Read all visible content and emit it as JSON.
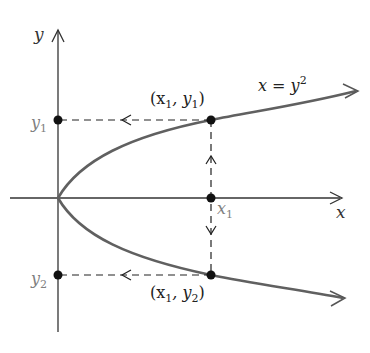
{
  "diagram": {
    "type": "graph-of-relation",
    "colors": {
      "axis": "#333333",
      "curve": "#606060",
      "dashed": "#222222",
      "point": "#111111",
      "grey_label": "#808080",
      "background": "#ffffff"
    },
    "axes": {
      "x_label": "x",
      "y_label": "y"
    },
    "curve": {
      "equation_lhs": "x = y",
      "equation_exp": "2"
    },
    "points": [
      {
        "name": "upper-point",
        "label_open": "(x",
        "sub1": "1",
        "label_mid": ", y",
        "sub2": "1",
        "label_close": ")"
      },
      {
        "name": "lower-point",
        "label_open": "(x",
        "sub1": "1",
        "label_mid": ", y",
        "sub2": "2",
        "label_close": ")"
      }
    ],
    "tick_labels": {
      "y1_main": "y",
      "y1_sub": "1",
      "y2_main": "y",
      "y2_sub": "2",
      "x1_main": "x",
      "x1_sub": "1"
    }
  }
}
